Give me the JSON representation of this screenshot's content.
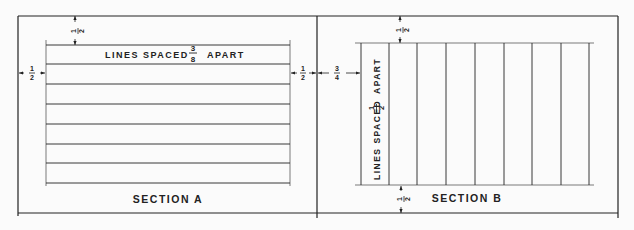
{
  "drawing": {
    "section_a": {
      "title": "SECTION A",
      "note_prefix": "LINES SPACED",
      "note_frac_num": "3",
      "note_frac_den": "8",
      "note_suffix": "APART",
      "dim_top": {
        "num": "1",
        "den": "2"
      },
      "dim_left": {
        "num": "1",
        "den": "2"
      },
      "dim_right": {
        "num": "1",
        "den": "2"
      },
      "line_count": 8,
      "line_orientation": "horizontal"
    },
    "section_b": {
      "title": "SECTION B",
      "note_prefix": "LINES SPACED",
      "note_frac_num": "1",
      "note_frac_den": "2",
      "note_suffix": "APART",
      "dim_top": {
        "num": "1",
        "den": "2"
      },
      "dim_left": {
        "num": "3",
        "den": "4"
      },
      "dim_bottom": {
        "num": "1",
        "den": "2"
      },
      "line_count": 9,
      "line_orientation": "vertical"
    },
    "colors": {
      "line": "#222222",
      "background": "#fbfbfb"
    }
  }
}
